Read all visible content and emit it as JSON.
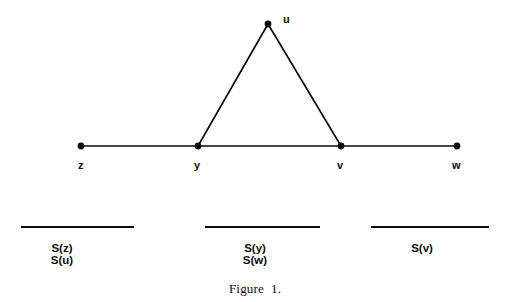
{
  "figure": {
    "caption": "Figure  1.",
    "background_color": "#ffffff",
    "ink_color": "#0d0d0d"
  },
  "graph": {
    "nodes": [
      {
        "id": "z",
        "label": "z",
        "x": 81,
        "y": 146,
        "label_x": 78,
        "label_y": 160
      },
      {
        "id": "y",
        "label": "y",
        "x": 198,
        "y": 146,
        "label_x": 194,
        "label_y": 160
      },
      {
        "id": "v",
        "label": "v",
        "x": 341,
        "y": 146,
        "label_x": 337,
        "label_y": 160
      },
      {
        "id": "w",
        "label": "w",
        "x": 457,
        "y": 146,
        "label_x": 452,
        "label_y": 160
      },
      {
        "id": "u",
        "label": "u",
        "x": 268,
        "y": 24,
        "label_x": 283,
        "label_y": 14
      }
    ],
    "edges": [
      {
        "from": "z",
        "to": "y"
      },
      {
        "from": "y",
        "to": "v"
      },
      {
        "from": "v",
        "to": "w"
      },
      {
        "from": "y",
        "to": "u"
      },
      {
        "from": "u",
        "to": "v"
      }
    ]
  },
  "partitions": [
    {
      "name": "partition-left",
      "bar": {
        "x1": 21,
        "x2": 134,
        "y": 227
      },
      "lines": [
        "S(z)",
        "S(u)"
      ],
      "center_x": 62,
      "text_y": 242
    },
    {
      "name": "partition-middle",
      "bar": {
        "x1": 205,
        "x2": 320,
        "y": 227
      },
      "lines": [
        "S(y)",
        "S(w)"
      ],
      "center_x": 255,
      "text_y": 242
    },
    {
      "name": "partition-right",
      "bar": {
        "x1": 371,
        "x2": 489,
        "y": 227
      },
      "lines": [
        "S(v)"
      ],
      "center_x": 422,
      "text_y": 242
    }
  ],
  "caption_position": {
    "x": 255,
    "y": 281
  }
}
